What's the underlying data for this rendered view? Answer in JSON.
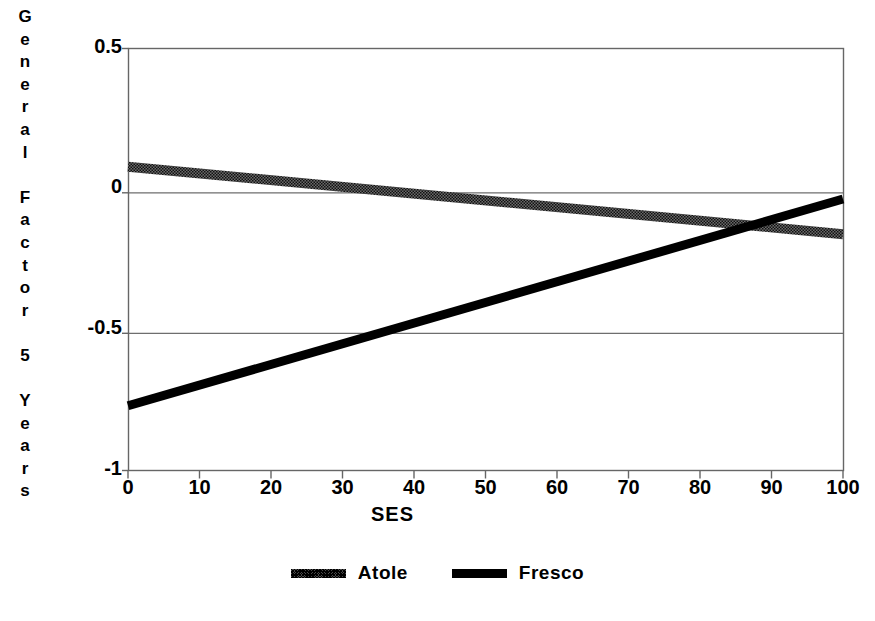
{
  "chart_data": {
    "type": "line",
    "title": "",
    "xlabel": "SES",
    "ylabel": "General Factor 5 Years",
    "xlim": [
      0,
      100
    ],
    "ylim": [
      -1,
      0.5
    ],
    "xticks": [
      0,
      10,
      20,
      30,
      40,
      50,
      60,
      70,
      80,
      90,
      100
    ],
    "xtick_labels": [
      "0",
      "10",
      "20",
      "30",
      "40",
      "50",
      "60",
      "70",
      "80",
      "90",
      "100"
    ],
    "yticks": [
      0.5,
      0,
      -0.5,
      -1
    ],
    "ytick_labels": [
      "0.5",
      "0",
      "-0.5",
      "-1"
    ],
    "grid": "horizontal-only",
    "legend_position": "bottom-center",
    "series": [
      {
        "name": "Atole",
        "style": "hatched-thick",
        "color": "#3d3d3d",
        "x": [
          0,
          100
        ],
        "values": [
          0.08,
          -0.16
        ]
      },
      {
        "name": "Fresco",
        "style": "solid-thick",
        "color": "#000000",
        "x": [
          0,
          100
        ],
        "values": [
          -0.77,
          -0.035
        ]
      }
    ],
    "annotations": [
      {
        "text": "lines cross",
        "x": 86,
        "y": -0.13
      }
    ]
  },
  "axes": {
    "y_title_chars": [
      "G",
      "e",
      "n",
      "e",
      "r",
      "a",
      "l",
      "",
      "F",
      "a",
      "c",
      "t",
      "o",
      "r",
      "",
      "5",
      "",
      "Y",
      "e",
      "a",
      "r",
      "s"
    ],
    "x_title": "SES",
    "y_tick_labels": [
      {
        "text": "0.5",
        "value": 0.5
      },
      {
        "text": "0",
        "value": 0
      },
      {
        "text": "-0.5",
        "value": -0.5
      },
      {
        "text": "-1",
        "value": -1
      }
    ],
    "x_tick_labels": [
      {
        "text": "0",
        "value": 0
      },
      {
        "text": "10",
        "value": 10
      },
      {
        "text": "20",
        "value": 20
      },
      {
        "text": "30",
        "value": 30
      },
      {
        "text": "40",
        "value": 40
      },
      {
        "text": "50",
        "value": 50
      },
      {
        "text": "60",
        "value": 60
      },
      {
        "text": "70",
        "value": 70
      },
      {
        "text": "80",
        "value": 80
      },
      {
        "text": "90",
        "value": 90
      },
      {
        "text": "100",
        "value": 100
      }
    ]
  },
  "legend": {
    "entries": [
      {
        "label": "Atole",
        "swatch": "hatched-line-swatch"
      },
      {
        "label": "Fresco",
        "swatch": "solid-line-swatch"
      }
    ]
  },
  "colors": {
    "background": "#ffffff",
    "axis": "#555555",
    "grid": "#777777",
    "atole": "#3d3d3d",
    "fresco": "#000000"
  }
}
